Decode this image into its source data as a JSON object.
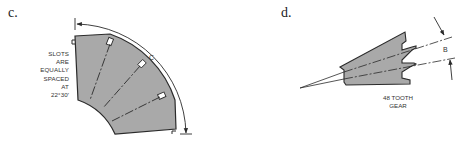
{
  "figure_c": {
    "label": "c.",
    "note_lines": [
      "SLOTS",
      "ARE",
      "EQUALLY",
      "SPACED",
      "AT",
      "22°30′"
    ],
    "dimension_label": "C",
    "part_fill": "#a9a9a9",
    "line_color": "#2a2a2a"
  },
  "figure_d": {
    "label": "d.",
    "dimension_label": "B",
    "note_lines": [
      "48 TOOTH",
      "GEAR"
    ],
    "part_fill": "#a9a9a9",
    "line_color": "#2a2a2a"
  }
}
